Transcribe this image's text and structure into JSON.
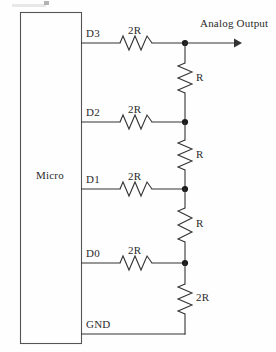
{
  "diagram": {
    "type": "schematic",
    "background_color": "#fefefe",
    "line_color": "#333333"
  },
  "micro": {
    "label": "Micro"
  },
  "output": {
    "label": "Analog Output"
  },
  "ground": {
    "label": "GND"
  },
  "pins": [
    {
      "name": "D3",
      "series_resistor": "2R"
    },
    {
      "name": "D2",
      "series_resistor": "2R"
    },
    {
      "name": "D1",
      "series_resistor": "2R"
    },
    {
      "name": "D0",
      "series_resistor": "2R"
    }
  ],
  "ladder_resistors": [
    {
      "label": "R"
    },
    {
      "label": "R"
    },
    {
      "label": "R"
    },
    {
      "label": "2R"
    }
  ]
}
